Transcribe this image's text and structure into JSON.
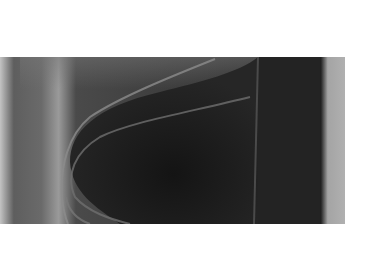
{
  "image": {
    "description": "Grayscale image of a curved nose-shaped dark body with light outline arcs on a gray field, white margins",
    "colors": {
      "background": "#ffffff",
      "field_light": "#b8b8b8",
      "field_mid": "#6e6e6e",
      "body_dark": "#1c1c1c",
      "outline": "#8a8a8a",
      "right_band": "#a8a8a8"
    }
  }
}
